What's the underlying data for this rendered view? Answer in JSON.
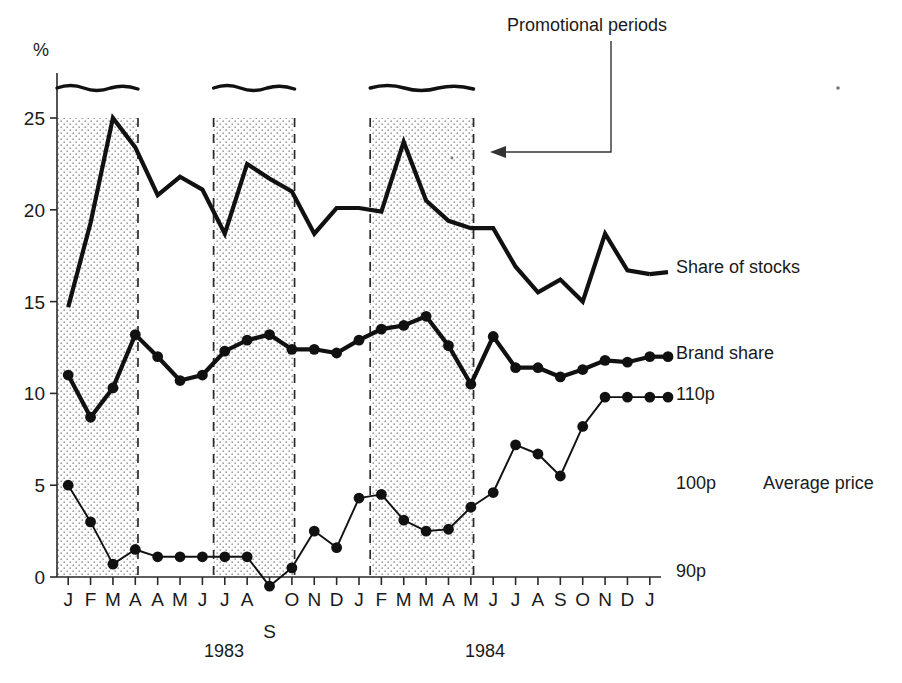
{
  "figure": {
    "y_axis_unit_label": "%",
    "annotation": "Promotional periods",
    "year_labels": [
      {
        "text": "1983",
        "x": 224
      },
      {
        "text": "1984",
        "x": 485
      }
    ],
    "right_labels": [
      {
        "text": "Share of stocks",
        "x": 676,
        "y": 273
      },
      {
        "text": "Brand share",
        "x": 676,
        "y": 359
      },
      {
        "text": "110p",
        "x": 676,
        "y": 400
      },
      {
        "text": "100p",
        "x": 676,
        "y": 489
      },
      {
        "text": "Average price",
        "x": 763,
        "y": 489
      },
      {
        "text": "90p",
        "x": 676,
        "y": 577
      }
    ]
  },
  "chart_data": {
    "type": "line",
    "title": "",
    "xlabel": "",
    "ylabel": "%",
    "ylim": [
      0,
      27
    ],
    "yticks": [
      0,
      5,
      10,
      15,
      20,
      25
    ],
    "grid": false,
    "legend_position": "right-inline",
    "x_tick_labels": [
      "J",
      "F",
      "M",
      "A",
      "A",
      "M",
      "J",
      "J",
      "A",
      "S",
      "O",
      "N",
      "D",
      "J",
      "F",
      "M",
      "M",
      "A",
      "M",
      "J",
      "J",
      "A",
      "S",
      "O",
      "N",
      "D",
      "J"
    ],
    "x_index": [
      0,
      1,
      2,
      3,
      4,
      5,
      6,
      7,
      8,
      9,
      10,
      11,
      12,
      13,
      14,
      15,
      16,
      17,
      18,
      19,
      20,
      21,
      22,
      23,
      24,
      25,
      26
    ],
    "price_axis_labels": [
      "90p",
      "100p",
      "110p"
    ],
    "series": [
      {
        "name": "Share of stocks",
        "style": "thick-line-no-markers",
        "values": [
          14.7,
          19.3,
          25.0,
          23.4,
          20.8,
          21.8,
          21.1,
          18.7,
          22.5,
          21.7,
          21.0,
          18.7,
          20.1,
          20.1,
          19.9,
          23.7,
          20.5,
          19.4,
          19.0,
          19.0,
          16.9,
          15.5,
          16.2,
          15.0,
          18.7,
          16.7,
          16.5
        ]
      },
      {
        "name": "Brand share",
        "style": "thick-line-with-markers",
        "values": [
          11.0,
          8.7,
          10.3,
          13.2,
          12.0,
          10.7,
          11.0,
          12.3,
          12.9,
          13.2,
          12.4,
          12.4,
          12.2,
          12.9,
          13.5,
          13.7,
          14.2,
          12.6,
          10.5,
          13.1,
          11.4,
          11.4,
          10.9,
          11.3,
          11.8,
          11.7,
          12.0
        ]
      },
      {
        "name": "Average price",
        "style": "thin-line-with-markers",
        "unit": "pence",
        "values": [
          5.0,
          3.0,
          0.7,
          1.5,
          1.1,
          1.1,
          1.1,
          1.1,
          1.1,
          -0.5,
          0.5,
          2.5,
          1.6,
          4.3,
          4.5,
          3.1,
          2.5,
          2.6,
          3.8,
          4.6,
          7.2,
          6.7,
          5.5,
          8.2,
          9.8,
          9.8,
          9.8
        ]
      }
    ],
    "promotional_periods": [
      {
        "start_index": 0,
        "end_index": 3,
        "label": "Promotional periods"
      },
      {
        "start_index": 7,
        "end_index": 10,
        "label": "Promotional periods"
      },
      {
        "start_index": 14,
        "end_index": 18,
        "label": "Promotional periods"
      }
    ]
  }
}
